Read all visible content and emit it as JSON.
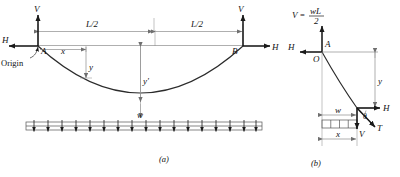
{
  "figure": {
    "caption_a": "(a)",
    "caption_b": "(b)",
    "colors": {
      "ink": "#1a1a1a",
      "curve": "#2b2b2b",
      "dimension": "#8c8c8c",
      "background": "#ffffff"
    }
  },
  "diagram_a": {
    "name": "full-span-cable",
    "labels": {
      "support_a": "A",
      "support_b": "B",
      "origin": "Origin",
      "reaction_v_left": "V",
      "reaction_h_left": "H",
      "reaction_v_right": "V",
      "reaction_h_right": "H",
      "coord_x": "x",
      "coord_y": "y",
      "sag_center": "y'",
      "half_span_left": "L/2",
      "half_span_right": "L/2",
      "distributed_load": "w"
    }
  },
  "diagram_b": {
    "name": "free-body-segment",
    "labels": {
      "origin_point": "O",
      "support_a": "A",
      "reaction_formula_lhs": "V",
      "reaction_formula_eq": "=",
      "reaction_formula_num": "wL",
      "reaction_formula_den": "2",
      "reaction_h": "H",
      "coord_y": "y",
      "coord_x": "x",
      "distributed_load": "w",
      "shear_v": "V",
      "tension_t": "T",
      "angle_theta": "θ"
    }
  },
  "geometry": {
    "span_note": "L/2 + L/2 = L",
    "load_arrow_count": 17,
    "load_block_cells": 4
  }
}
